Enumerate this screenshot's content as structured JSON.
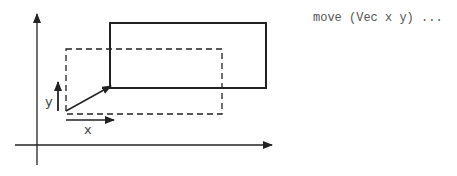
{
  "diagram": {
    "code_text": "move (Vec x y) ...",
    "labels": {
      "x": "x",
      "y": "y"
    },
    "axes": {
      "x_axis": "horizontal axis with arrow",
      "y_axis": "vertical axis with arrow"
    },
    "shapes": {
      "original_rect": "dashed rectangle",
      "moved_rect": "solid rectangle",
      "translation_vector": "diagonal arrow"
    },
    "colors": {
      "stroke": "#222222",
      "text": "#444444"
    }
  }
}
